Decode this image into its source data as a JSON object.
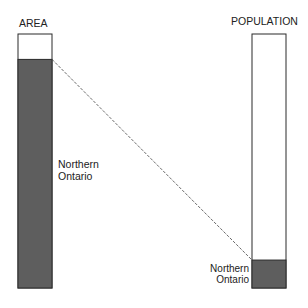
{
  "chart_data": {
    "type": "bar",
    "title": "",
    "categories": [
      "AREA",
      "POPULATION"
    ],
    "series": [
      {
        "name": "Northern Ontario",
        "values": [
          90,
          11
        ]
      },
      {
        "name": "Rest of Ontario",
        "values": [
          10,
          89
        ]
      }
    ],
    "units": "percent of Ontario total",
    "highlight_label": "Northern\nOntario",
    "connector": "dashed line linking top of Northern Ontario segment in AREA bar to top of Northern Ontario segment in POPULATION bar",
    "colors": {
      "highlight": "#5e5e5e",
      "rest": "#ffffff",
      "outline": "#2a2a2a"
    },
    "ylim": [
      0,
      100
    ],
    "grid": false,
    "legend": "none"
  },
  "labels": {
    "area_title": "AREA",
    "population_title": "POPULATION",
    "area_segment_line1": "Northern",
    "area_segment_line2": "Ontario",
    "pop_segment_line1": "Northern",
    "pop_segment_line2": "Ontario"
  }
}
